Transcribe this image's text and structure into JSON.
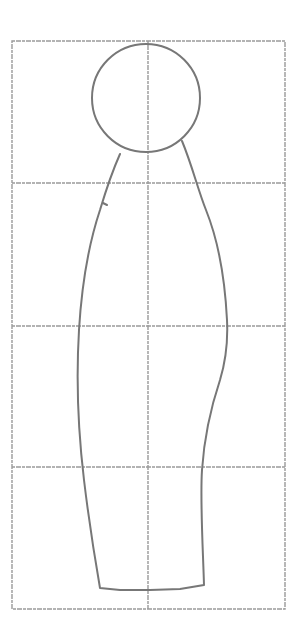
{
  "diagram": {
    "style": "pencil sketch on grid",
    "colors": {
      "background": "#ffffff",
      "grid": "#9a9a9a",
      "figure": "#777777"
    },
    "grid": {
      "frame": {
        "x": 12,
        "y": 41,
        "width": 273,
        "height": 568
      },
      "columns": 2,
      "rows": 4,
      "vertical_lines_x": [
        148
      ],
      "horizontal_lines_y": [
        183,
        326,
        467
      ]
    },
    "head": {
      "shape": "circle",
      "cx": 146,
      "cy": 98,
      "r": 54
    },
    "body": {
      "shape": "elongated tapered outline",
      "top_y": 150,
      "bottom_y": 588
    }
  }
}
